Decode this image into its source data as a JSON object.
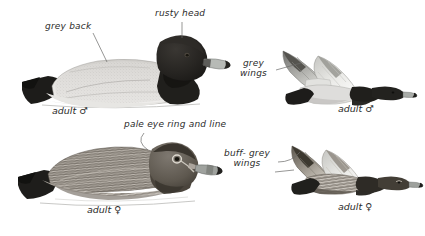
{
  "plate": {
    "title": "Diving duck identification plate",
    "background_color": "#ffffff",
    "ink_color": "#2b2b2b"
  },
  "annotations": [
    {
      "id": "grey-back",
      "text": "grey back",
      "x": 45,
      "y": 26
    },
    {
      "id": "rusty-head",
      "text": "rusty head",
      "x": 157,
      "y": 13
    },
    {
      "id": "pale-eye-ring",
      "text": "pale eye ring and line",
      "x": 126,
      "y": 124
    },
    {
      "id": "grey-wings",
      "text": "grey\nwings",
      "x": 243,
      "y": 63
    },
    {
      "id": "buff-grey-wings",
      "text": "buff- grey\nwings",
      "x": 228,
      "y": 152
    }
  ],
  "captions": [
    {
      "id": "adult-male-swim",
      "text": "adult ♂",
      "x": 54,
      "y": 110
    },
    {
      "id": "adult-female-swim",
      "text": "adult ♀",
      "x": 89,
      "y": 209
    },
    {
      "id": "adult-male-fly",
      "text": "adult ♂",
      "x": 340,
      "y": 108
    },
    {
      "id": "adult-female-fly",
      "text": "adult ♀",
      "x": 340,
      "y": 206
    }
  ],
  "figures": [
    {
      "id": "swimming-adult-male",
      "label": "adult male swimming",
      "pose": "swimming",
      "features": [
        "dark rusty head",
        "black breast",
        "pale grey vermiculated back",
        "black tail",
        "grey bill with dark tip"
      ]
    },
    {
      "id": "swimming-adult-female",
      "label": "adult female swimming",
      "pose": "swimming",
      "features": [
        "brown head",
        "pale eye ring and line",
        "barred grey-brown flanks",
        "dark tail"
      ]
    },
    {
      "id": "flying-adult-male",
      "label": "adult male in flight",
      "pose": "flying",
      "features": [
        "grey wings",
        "dark head and neck",
        "pale body",
        "dark tail"
      ]
    },
    {
      "id": "flying-adult-female",
      "label": "adult female in flight",
      "pose": "flying",
      "features": [
        "buff-grey wings",
        "brown head",
        "mottled body",
        "dark tail"
      ]
    }
  ],
  "palette": {
    "ink": "#2b2b2b",
    "head_dark": "#262523",
    "back_pale": "#d8d8d6",
    "back_pale_mid": "#c7c7c4",
    "black": "#1c1b19",
    "bill_grey": "#b9bcb8",
    "female_brown": "#6e6861",
    "female_body": "#8a847d",
    "wing_grey": "#9b9b98",
    "wing_pale": "#e3e3e0",
    "water": "#b9b9b6"
  }
}
